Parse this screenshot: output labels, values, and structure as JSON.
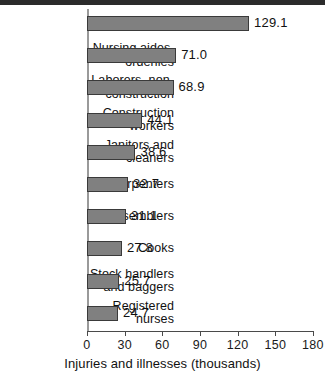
{
  "chart_data": {
    "type": "bar",
    "orientation": "horizontal",
    "title": "",
    "xlabel": "Injuries and illnesses (thousands)",
    "ylabel": "",
    "xlim": [
      0,
      180
    ],
    "xticks": [
      0,
      30,
      60,
      90,
      120,
      150,
      180
    ],
    "xtick_labels": [
      "0",
      "30",
      "60",
      "90",
      "120",
      "150",
      "180"
    ],
    "grid": false,
    "legend": null,
    "bar_color": "#808080",
    "bar_edge_color": "#3a3a3a",
    "categories": [
      "Truck drivers",
      "Nursing aides, orderlies",
      "Laborers, non-construction",
      "Construction workers",
      "Janitors and cleaners",
      "Carpenters",
      "Assemblers",
      "Cooks",
      "Stock handlers and baggers",
      "Registered nurses"
    ],
    "category_lines": [
      [
        "Truck drivers"
      ],
      [
        "Nursing aides,",
        "orderlies"
      ],
      [
        "Laborers, non-",
        "construction"
      ],
      [
        "Construction",
        "workers"
      ],
      [
        "Janitors and",
        "cleaners"
      ],
      [
        "Carpenters"
      ],
      [
        "Assemblers"
      ],
      [
        "Cooks"
      ],
      [
        "Stock handlers",
        "and baggers"
      ],
      [
        "Registered",
        "nurses"
      ]
    ],
    "values": [
      129.1,
      71.0,
      68.9,
      44.1,
      38.6,
      32.7,
      31.1,
      27.8,
      25.7,
      24.7
    ],
    "value_labels": [
      "129.1",
      "71.0",
      "68.9",
      "44.1",
      "38.6",
      "32.7",
      "31.1",
      "27.8",
      "25.7",
      "24.7"
    ]
  }
}
